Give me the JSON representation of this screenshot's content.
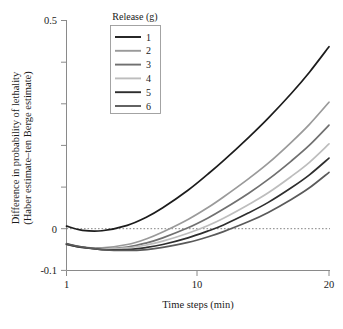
{
  "chart_data": {
    "type": "line",
    "title": "",
    "xlabel": "Time steps (min)",
    "ylabel": "Difference in probability of lethality (Haber estimate–ten Berge estimate)",
    "ylabel_line1": "Difference in probability of lethality",
    "ylabel_line2": "(Haber estimate–ten Berge estimate)",
    "xscale": "log",
    "xlim": [
      1,
      20
    ],
    "ylim": [
      -0.1,
      0.5
    ],
    "xticks": [
      1,
      10,
      20
    ],
    "xtick_labels": [
      "1",
      "10",
      "20"
    ],
    "yticks": [
      -0.1,
      0,
      0.1,
      0.2,
      0.3,
      0.4,
      0.5
    ],
    "ytick_labels": [
      "-0.1",
      "0",
      "",
      "",
      "",
      "",
      "0.5"
    ],
    "ytick_labels_visible": [
      "0.5",
      "0",
      "-0.1"
    ],
    "grid": false,
    "reference_line": {
      "y": 0,
      "style": "dashed",
      "color": "#777777"
    },
    "legend": {
      "title": "Release (g)",
      "position": "top-left-inside",
      "entries": [
        "1",
        "2",
        "3",
        "4",
        "5",
        "6"
      ]
    },
    "x": [
      1,
      1.2,
      1.5,
      2,
      2.5,
      3,
      4,
      5,
      6,
      8,
      10,
      13,
      16,
      20
    ],
    "series": [
      {
        "name": "1",
        "color": "#1c1c1c",
        "values": [
          0.006,
          -0.004,
          -0.005,
          0.008,
          0.028,
          0.05,
          0.092,
          0.13,
          0.163,
          0.219,
          0.265,
          0.324,
          0.375,
          0.436
        ]
      },
      {
        "name": "2",
        "color": "#9a9a9a",
        "values": [
          -0.037,
          -0.044,
          -0.046,
          -0.038,
          -0.024,
          -0.008,
          0.022,
          0.05,
          0.076,
          0.12,
          0.157,
          0.207,
          0.25,
          0.303
        ]
      },
      {
        "name": "3",
        "color": "#707070",
        "values": [
          -0.038,
          -0.045,
          -0.048,
          -0.044,
          -0.034,
          -0.022,
          0.002,
          0.025,
          0.047,
          0.085,
          0.118,
          0.162,
          0.2,
          0.248
        ]
      },
      {
        "name": "4",
        "color": "#bdbdbd",
        "values": [
          -0.037,
          -0.044,
          -0.048,
          -0.046,
          -0.039,
          -0.03,
          -0.011,
          0.007,
          0.025,
          0.058,
          0.086,
          0.125,
          0.159,
          0.203
        ]
      },
      {
        "name": "5",
        "color": "#2e2e2e",
        "values": [
          -0.037,
          -0.045,
          -0.05,
          -0.05,
          -0.045,
          -0.038,
          -0.022,
          -0.006,
          0.009,
          0.038,
          0.063,
          0.098,
          0.129,
          0.169
        ]
      },
      {
        "name": "6",
        "color": "#5a5a5a",
        "values": [
          -0.036,
          -0.044,
          -0.05,
          -0.052,
          -0.05,
          -0.045,
          -0.033,
          -0.02,
          -0.007,
          0.017,
          0.039,
          0.07,
          0.098,
          0.135
        ]
      }
    ]
  },
  "axes": {
    "y_top_label": "0.5",
    "y_zero_label": "0",
    "y_bottom_label": "-0.1",
    "x_first_label": "1",
    "x_mid_label": "10",
    "x_last_label": "20",
    "x_title": "Time steps (min)",
    "y_title_line1": "Difference in probability of lethality",
    "y_title_line2": "(Haber estimate–ten Berge estimate)"
  },
  "legend": {
    "title": "Release (g)",
    "items": [
      {
        "label": "1",
        "color": "#1c1c1c"
      },
      {
        "label": "2",
        "color": "#9a9a9a"
      },
      {
        "label": "3",
        "color": "#707070"
      },
      {
        "label": "4",
        "color": "#bdbdbd"
      },
      {
        "label": "5",
        "color": "#2e2e2e"
      },
      {
        "label": "6",
        "color": "#5a5a5a"
      }
    ]
  }
}
